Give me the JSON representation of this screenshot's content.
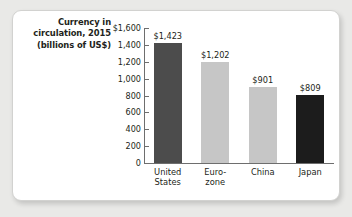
{
  "figure": {
    "title_lines": [
      "Currency in",
      "circulation, 2015",
      "(billions of US$)"
    ],
    "card_background": "#ffffff",
    "page_background": "#e9e9e7",
    "axis_color": "#6e6e6e",
    "text_color": "#231f20"
  },
  "chart_data": {
    "type": "bar",
    "title": "Currency in circulation, 2015 (billions of US$)",
    "xlabel": "",
    "ylabel": "",
    "ylim": [
      0,
      1600
    ],
    "grid": false,
    "legend": "none",
    "categories": [
      "United States",
      "Euro-zone",
      "China",
      "Japan"
    ],
    "category_label_lines": [
      [
        "United",
        "States"
      ],
      [
        "Euro-",
        "zone"
      ],
      [
        "China"
      ],
      [
        "Japan"
      ]
    ],
    "values": [
      1423,
      1202,
      901,
      809
    ],
    "value_labels": [
      "$1,423",
      "$1,202",
      "$901",
      "$809"
    ],
    "bar_colors": [
      "#4c4c4c",
      "#c6c6c6",
      "#c6c6c6",
      "#1c1c1c"
    ],
    "y_ticks": [
      1600,
      1400,
      1200,
      1000,
      800,
      600,
      400,
      200,
      0
    ],
    "y_tick_labels": [
      "$1,600",
      "1,400",
      "1,200",
      "1,000",
      "800",
      "600",
      "400",
      "200",
      "0"
    ]
  }
}
